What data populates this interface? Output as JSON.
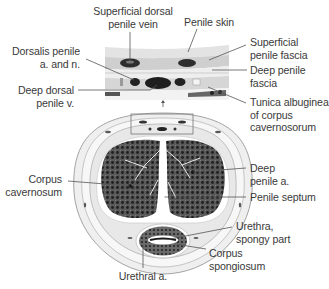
{
  "diagram": {
    "colors": {
      "background": "#ffffff",
      "text": "#3a3a3a",
      "leader": "#555555",
      "tissue_dark": "#3b3b3b",
      "tissue_mid": "#8a8a8a",
      "fascia": "#d9d9d9",
      "skin": "#e6e6e6"
    },
    "labels": {
      "superficial_dorsal_vein": [
        "Superficial dorsal",
        "penile vein"
      ],
      "penile_skin": [
        "Penile skin"
      ],
      "superficial_fascia": [
        "Superficial",
        "penile fascia"
      ],
      "dorsalis_penile": [
        "Dorsalis penile",
        "a. and n."
      ],
      "deep_fascia": [
        "Deep penile",
        "fascia"
      ],
      "deep_dorsal_vein": [
        "Deep dorsal",
        "penile v."
      ],
      "tunica_albuginea": [
        "Tunica albuginea",
        "of corpus",
        "cavernosorum"
      ],
      "deep_penile_artery": [
        "Deep",
        "penile a."
      ],
      "corpus_cavernosum": [
        "Corpus",
        "cavernosum"
      ],
      "penile_septum": [
        "Penile septum"
      ],
      "urethra": [
        "Urethra,",
        "spongy part"
      ],
      "corpus_spongiosum": [
        "Corpus",
        "spongiosum"
      ],
      "urethral_artery": [
        "Urethral a."
      ]
    }
  }
}
